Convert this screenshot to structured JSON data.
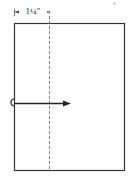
{
  "diagram": {
    "dimension_label": "1¼\"",
    "elements": {
      "page_outline": "rectangle",
      "fold_line": "dashed vertical line",
      "fold_arrow": "arrow pointing right from left edge with hook"
    },
    "colors": {
      "stroke": "#333333",
      "dashed": "#777777",
      "background": "#ffffff"
    }
  }
}
